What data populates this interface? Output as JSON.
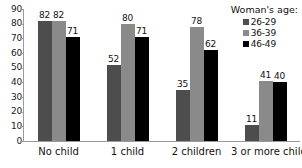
{
  "chart_data": {
    "type": "bar",
    "title": "",
    "xlabel": "",
    "ylabel": "",
    "ylim": [
      0,
      90
    ],
    "ytick_step": 10,
    "yticks": [
      "0",
      "10",
      "20",
      "30",
      "40",
      "50",
      "60",
      "70",
      "80",
      "90"
    ],
    "grid": false,
    "categories": [
      "No child",
      "1 child",
      "2 children",
      "3 or more children"
    ],
    "legend_position": "top-right",
    "legend_title": "Woman's age:",
    "series": [
      {
        "name": "26-29",
        "color": "#4d4d4d",
        "values": [
          82,
          52,
          35,
          11
        ],
        "labels": [
          "82",
          "52",
          "35",
          "11"
        ]
      },
      {
        "name": "36-39",
        "color": "#8a8a8a",
        "values": [
          82,
          80,
          78,
          41
        ],
        "labels": [
          "82",
          "80",
          "78",
          "41"
        ]
      },
      {
        "name": "46-49",
        "color": "#000000",
        "values": [
          71,
          71,
          62,
          40
        ],
        "labels": [
          "71",
          "71",
          "62",
          "40"
        ]
      }
    ]
  }
}
